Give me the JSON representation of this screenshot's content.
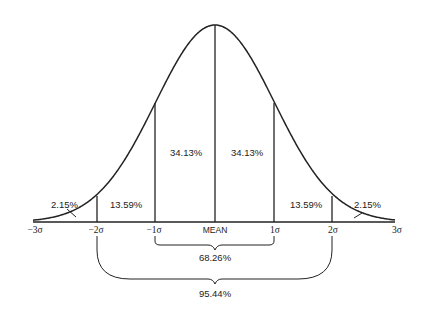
{
  "diagram": {
    "title": "",
    "type": "normal-distribution",
    "axis_labels": [
      {
        "id": "neg3",
        "text": "−3σ",
        "x": 35
      },
      {
        "id": "neg2",
        "text": "−2σ",
        "x": 97
      },
      {
        "id": "neg1",
        "text": "−1σ",
        "x": 155
      },
      {
        "id": "mean",
        "text": "MEAN",
        "x": 215
      },
      {
        "id": "pos1",
        "text": "1σ",
        "x": 274
      },
      {
        "id": "pos2",
        "text": "2σ",
        "x": 332
      },
      {
        "id": "pos3",
        "text": "3σ",
        "x": 393
      }
    ],
    "regions": [
      {
        "id": "tail-left",
        "label": "2.15%"
      },
      {
        "id": "neg2-neg1",
        "label": "13.59%"
      },
      {
        "id": "neg1-mean",
        "label": "34.13%"
      },
      {
        "id": "mean-pos1",
        "label": "34.13%"
      },
      {
        "id": "pos1-pos2",
        "label": "13.59%"
      },
      {
        "id": "tail-right",
        "label": "2.15%"
      }
    ],
    "braces": [
      {
        "id": "one-sigma",
        "span": "−1σ to 1σ",
        "label": "68.26%"
      },
      {
        "id": "two-sigma",
        "span": "−2σ to 2σ",
        "label": "95.44%"
      }
    ],
    "colors": {
      "stroke": "#222222",
      "background": "#ffffff"
    }
  }
}
